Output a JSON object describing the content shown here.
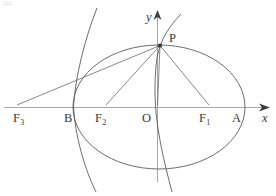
{
  "figure": {
    "kind": "geometry-diagram",
    "background_color": "#ffffff",
    "curve_color": "#4a4a4a",
    "axis_color": "#9a9a9a",
    "label_color": "#3a3a3a",
    "axes": {
      "x_axis_label": "x",
      "y_axis_label": "y",
      "origin_label": "O",
      "x_axis_y": 107,
      "y_axis_x": 157
    },
    "points": [
      {
        "name": "point-f3",
        "label": "F",
        "sub": "3",
        "x": 14,
        "y": 107,
        "label_x": 13,
        "label_y": 112
      },
      {
        "name": "point-b",
        "label": "B",
        "sub": "",
        "x": 73,
        "y": 107,
        "label_x": 64,
        "label_y": 112
      },
      {
        "name": "point-f2",
        "label": "F",
        "sub": "2",
        "x": 104,
        "y": 107,
        "label_x": 95,
        "label_y": 112
      },
      {
        "name": "point-o",
        "label": "O",
        "sub": "",
        "x": 157,
        "y": 107,
        "label_x": 142,
        "label_y": 112
      },
      {
        "name": "point-f1",
        "label": "F",
        "sub": "1",
        "x": 208,
        "y": 107,
        "label_x": 199,
        "label_y": 112
      },
      {
        "name": "point-a",
        "label": "A",
        "sub": "",
        "x": 244,
        "y": 107,
        "label_x": 232,
        "label_y": 112
      },
      {
        "name": "point-p",
        "label": "P",
        "sub": "",
        "x": 160,
        "y": 45,
        "label_x": 169,
        "label_y": 33
      }
    ],
    "ellipse": {
      "center_x": 159,
      "center_y": 107,
      "radius_x": 86,
      "radius_y": 62
    },
    "hyperbola": {
      "left_branch_vertex_x": 73,
      "right_branch_through_point": "P",
      "center_x": 117
    },
    "segments": [
      {
        "name": "segment-p-f3",
        "from": "P",
        "to": "F3"
      },
      {
        "name": "segment-p-f2",
        "from": "P",
        "to": "F2"
      },
      {
        "name": "segment-p-o",
        "from": "P",
        "to": "O"
      },
      {
        "name": "segment-p-f1",
        "from": "P",
        "to": "F1"
      }
    ]
  }
}
